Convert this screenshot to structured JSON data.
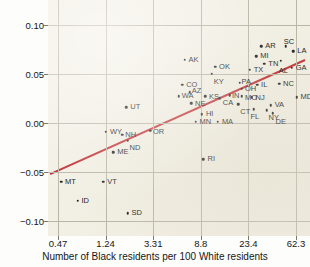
{
  "chart_data": {
    "type": "scatter",
    "title": "",
    "xlabel": "Number of Black residents per 100 White residents",
    "ylabel": "Implicit ingroup bias",
    "xscale": "log",
    "xticks": [
      "0.47",
      "1.24",
      "3.31",
      "8.8",
      "23.4",
      "62.3"
    ],
    "yticks": [
      "0.10",
      "0.05",
      "0.00",
      "-0.05",
      "-0.10"
    ],
    "ylim": [
      -0.115,
      0.125
    ],
    "grid": true,
    "legend": "none",
    "fit_line": {
      "color": "#c1272d",
      "label": "regression line",
      "x_start": "0.40",
      "y_start": -0.052,
      "x_end": "75.0",
      "y_end": 0.064
    },
    "point_color": "#1a1a1a",
    "points": [
      {
        "label": "MS",
        "x": 97.0,
        "y": 0.121,
        "lx": 4,
        "ly": -4
      },
      {
        "label": "LA",
        "x": 59.0,
        "y": 0.073,
        "lx": 4,
        "ly": -4
      },
      {
        "label": "SC",
        "x": 50.5,
        "y": 0.078,
        "lx": -2,
        "ly": -8
      },
      {
        "label": "AL",
        "x": 45.5,
        "y": 0.063,
        "lx": -2,
        "ly": 6
      },
      {
        "label": "GA",
        "x": 57.0,
        "y": 0.056,
        "lx": 4,
        "ly": -4
      },
      {
        "label": "AR",
        "x": 30.5,
        "y": 0.078,
        "lx": 4,
        "ly": -4
      },
      {
        "label": "MI",
        "x": 27.5,
        "y": 0.068,
        "lx": 4,
        "ly": -4
      },
      {
        "label": "TN",
        "x": 32.5,
        "y": 0.06,
        "lx": 4,
        "ly": -4
      },
      {
        "label": "TX",
        "x": 24.0,
        "y": 0.054,
        "lx": 4,
        "ly": -4
      },
      {
        "label": "AK",
        "x": 6.3,
        "y": 0.064,
        "lx": 4,
        "ly": -4
      },
      {
        "label": "OK",
        "x": 11.8,
        "y": 0.057,
        "lx": 4,
        "ly": -4
      },
      {
        "label": "KY",
        "x": 11.0,
        "y": 0.05,
        "lx": 2,
        "ly": 4
      },
      {
        "label": "NC",
        "x": 44.0,
        "y": 0.04,
        "lx": 4,
        "ly": -4
      },
      {
        "label": "IL",
        "x": 28.0,
        "y": 0.039,
        "lx": 4,
        "ly": -4
      },
      {
        "label": "PA",
        "x": 19.5,
        "y": 0.041,
        "lx": 2,
        "ly": -5
      },
      {
        "label": "CO",
        "x": 6.0,
        "y": 0.039,
        "lx": 4,
        "ly": -4
      },
      {
        "label": "AZ",
        "x": 7.0,
        "y": 0.031,
        "lx": 2,
        "ly": -5
      },
      {
        "label": "WA",
        "x": 5.6,
        "y": 0.027,
        "lx": 3,
        "ly": 0
      },
      {
        "label": "KS",
        "x": 9.6,
        "y": 0.027,
        "lx": 4,
        "ly": -3
      },
      {
        "label": "CA",
        "x": 13.0,
        "y": 0.025,
        "lx": 3,
        "ly": 1
      },
      {
        "label": "OH",
        "x": 20.5,
        "y": 0.035,
        "lx": 3,
        "ly": -4
      },
      {
        "label": "MO",
        "x": 20.5,
        "y": 0.027,
        "lx": 3,
        "ly": -2
      },
      {
        "label": "NJ",
        "x": 25.0,
        "y": 0.026,
        "lx": 4,
        "ly": -3
      },
      {
        "label": "IN",
        "x": 16.0,
        "y": 0.028,
        "lx": 2,
        "ly": -3
      },
      {
        "label": "CT",
        "x": 19.0,
        "y": 0.019,
        "lx": 2,
        "ly": 4
      },
      {
        "label": "NE",
        "x": 7.2,
        "y": 0.02,
        "lx": 4,
        "ly": -3
      },
      {
        "label": "MD",
        "x": 63.0,
        "y": 0.026,
        "lx": 4,
        "ly": -4
      },
      {
        "label": "VA",
        "x": 37.0,
        "y": 0.018,
        "lx": 4,
        "ly": -4
      },
      {
        "label": "FL",
        "x": 26.0,
        "y": 0.014,
        "lx": -3,
        "ly": 4
      },
      {
        "label": "NY",
        "x": 34.0,
        "y": 0.013,
        "lx": 2,
        "ly": 4
      },
      {
        "label": "DE",
        "x": 38.5,
        "y": 0.01,
        "lx": 3,
        "ly": 5
      },
      {
        "label": "UT",
        "x": 1.9,
        "y": 0.016,
        "lx": 4,
        "ly": -4
      },
      {
        "label": "HI",
        "x": 9.0,
        "y": 0.009,
        "lx": 4,
        "ly": -4
      },
      {
        "label": "MN",
        "x": 7.9,
        "y": 0.001,
        "lx": 4,
        "ly": -4
      },
      {
        "label": "MA",
        "x": 12.5,
        "y": 0.001,
        "lx": 4,
        "ly": -4
      },
      {
        "label": "WY",
        "x": 1.25,
        "y": -0.009,
        "lx": 4,
        "ly": -4
      },
      {
        "label": "NH",
        "x": 1.75,
        "y": -0.012,
        "lx": 3,
        "ly": 0
      },
      {
        "label": "ND",
        "x": 1.95,
        "y": -0.018,
        "lx": 2,
        "ly": 3
      },
      {
        "label": "OR",
        "x": 3.1,
        "y": -0.008,
        "lx": 3,
        "ly": -3
      },
      {
        "label": "ME",
        "x": 1.45,
        "y": -0.03,
        "lx": 4,
        "ly": -4
      },
      {
        "label": "RI",
        "x": 9.3,
        "y": -0.037,
        "lx": 4,
        "ly": -4
      },
      {
        "label": "MT",
        "x": 0.5,
        "y": -0.06,
        "lx": 4,
        "ly": -4
      },
      {
        "label": "VT",
        "x": 1.18,
        "y": -0.06,
        "lx": 4,
        "ly": -4
      },
      {
        "label": "ID",
        "x": 0.7,
        "y": -0.079,
        "lx": 4,
        "ly": -4
      },
      {
        "label": "SD",
        "x": 1.95,
        "y": -0.092,
        "lx": 4,
        "ly": -4
      }
    ]
  }
}
